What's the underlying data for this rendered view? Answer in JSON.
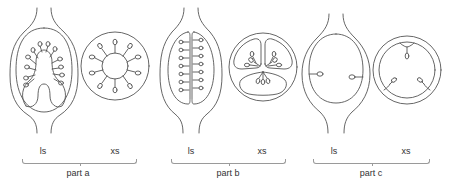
{
  "figure": {
    "stroke_color": "#555555",
    "parts": [
      {
        "id": "part-a",
        "label": "part a",
        "views": [
          {
            "label": "ls",
            "x": 44
          },
          {
            "label": "xs",
            "x": 115
          }
        ],
        "ovule_count_ls": 12,
        "ovule_count_xs": 10
      },
      {
        "id": "part-b",
        "label": "part b",
        "views": [
          {
            "label": "ls",
            "x": 190
          },
          {
            "label": "xs",
            "x": 262
          }
        ],
        "ovule_count_ls": 14,
        "locules_xs": 3
      },
      {
        "id": "part-c",
        "label": "part c",
        "views": [
          {
            "label": "ls",
            "x": 334
          },
          {
            "label": "xs",
            "x": 406
          }
        ],
        "ovule_count_ls": 2,
        "ovule_count_xs": 3
      }
    ]
  }
}
